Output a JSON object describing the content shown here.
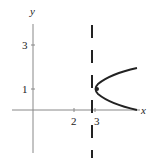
{
  "figure": {
    "axis_labels": {
      "x": "x",
      "y": "y"
    },
    "x_ticks": [
      {
        "label": "2",
        "value": 2
      },
      {
        "label": "3",
        "value": 3
      }
    ],
    "y_ticks": [
      {
        "label": "3",
        "value": 3
      },
      {
        "label": "1",
        "value": 1
      }
    ],
    "asymptote": {
      "label": "x = 3",
      "style": "dashed"
    },
    "curve": {
      "description": "right-opening parabola with vertex near (3, 1)"
    },
    "point": {
      "label": "vertex",
      "x": 3,
      "y": 1
    },
    "colors": {
      "ink": "#222222",
      "axis": "#888888",
      "background": "#ffffff"
    }
  }
}
